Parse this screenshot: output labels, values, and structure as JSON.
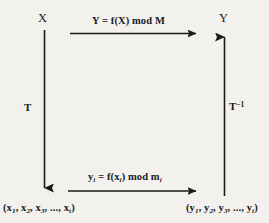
{
  "diagram": {
    "type": "commutative-diagram",
    "title_visible": false,
    "background_color": "#f2f1ee",
    "ink_color": "#1a1a1a",
    "nodes": {
      "top_left": "X",
      "top_right": "Y",
      "bottom_left": "(x₁, x₂, x₃, ..., xₜ)",
      "bottom_right": "(y₁, y₂, y₃, ..., yₜ)"
    },
    "edges": {
      "top": {
        "label": "Y = f(X) mod M",
        "direction": "right",
        "from": "X",
        "to": "Y"
      },
      "bottom": {
        "label": "yᵢ = f(xᵢ) mod mᵢ",
        "direction": "right",
        "from": "(x₁, x₂, x₃, ..., xₜ)",
        "to": "(y₁, y₂, y₃, ..., yₜ)"
      },
      "left": {
        "label": "T",
        "direction": "down",
        "from": "X",
        "to": "(x₁, x₂, x₃, ..., xₜ)"
      },
      "right": {
        "label": "T⁻¹",
        "direction": "up",
        "from": "(y₁, y₂, y₃, ..., yₜ)",
        "to": "Y"
      }
    }
  }
}
